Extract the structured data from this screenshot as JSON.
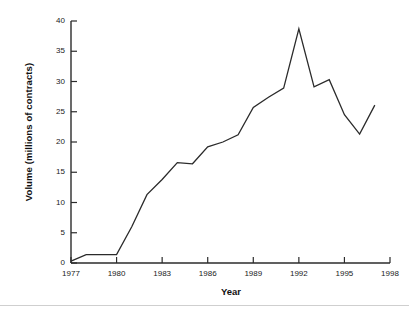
{
  "chart_data": {
    "type": "line",
    "title": "",
    "xlabel": "Year",
    "ylabel": "Volume (millions of contracts)",
    "xlim": [
      1977,
      1998
    ],
    "ylim": [
      0,
      40
    ],
    "xticks": [
      1977,
      1980,
      1983,
      1986,
      1989,
      1992,
      1995,
      1998
    ],
    "yticks": [
      0,
      5,
      10,
      15,
      20,
      25,
      30,
      35,
      40
    ],
    "grid": false,
    "legend": null,
    "series": [
      {
        "name": "Volume",
        "color": "#2b2b2b",
        "x": [
          1977,
          1978,
          1979,
          1980,
          1981,
          1982,
          1983,
          1984,
          1985,
          1986,
          1987,
          1988,
          1989,
          1990,
          1991,
          1992,
          1993,
          1994,
          1995,
          1996,
          1997
        ],
        "values": [
          0.3,
          1.4,
          1.4,
          1.4,
          6.0,
          11.3,
          13.8,
          16.6,
          16.4,
          19.2,
          20.0,
          21.2,
          25.7,
          27.4,
          28.9,
          38.7,
          29.1,
          30.3,
          24.5,
          21.3,
          26.1
        ]
      }
    ]
  },
  "axes": {
    "x_tick_labels": [
      "1977",
      "1980",
      "1983",
      "1986",
      "1989",
      "1992",
      "1995",
      "1998"
    ],
    "y_tick_labels": [
      "0",
      "5",
      "10",
      "15",
      "20",
      "25",
      "30",
      "35",
      "40"
    ],
    "x_axis_title": "Year",
    "y_axis_title": "Volume (millions of contracts)"
  }
}
